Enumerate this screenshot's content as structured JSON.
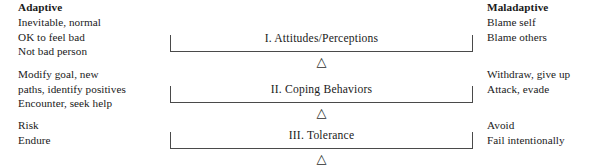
{
  "figure": {
    "background_color": "#ffffff",
    "ink_color": "#1a1a1a",
    "rule_color": "#4a4a4a"
  },
  "columns": {
    "left": {
      "header": "Adaptive",
      "groups": [
        {
          "lines": [
            "Inevitable, normal",
            "OK to feel bad",
            "Not bad person"
          ]
        },
        {
          "lines": [
            "Modify goal, new",
            "paths, identify positives",
            "Encounter, seek help"
          ]
        },
        {
          "lines": [
            "Risk",
            "Endure"
          ]
        }
      ]
    },
    "right": {
      "header": "Maladaptive",
      "groups": [
        {
          "lines": [
            "Blame self",
            "Blame others"
          ]
        },
        {
          "lines": [
            "Withdraw, give up",
            "Attack, evade"
          ]
        },
        {
          "lines": [
            "Avoid",
            "Fail intentionally"
          ]
        }
      ]
    }
  },
  "sections": [
    {
      "label": "I. Attitudes/Perceptions",
      "marker": "△"
    },
    {
      "label": "II. Coping Behaviors",
      "marker": "△"
    },
    {
      "label": "III. Tolerance",
      "marker": "△"
    }
  ]
}
